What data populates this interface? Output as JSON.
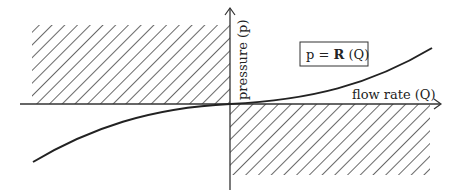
{
  "diagram": {
    "x_axis_label": "flow rate (Q)",
    "y_axis_label": "pressure (p)",
    "equation": {
      "lhs": "p = ",
      "operator": "R",
      "arg": " (Q)"
    },
    "regions": [
      {
        "name": "upper-left-hatched",
        "quadrant": "Q<0, p>0"
      },
      {
        "name": "lower-right-hatched",
        "quadrant": "Q>0, p<0"
      }
    ],
    "colors": {
      "line": "#222222",
      "hatch": "#444444",
      "background": "#ffffff"
    }
  }
}
